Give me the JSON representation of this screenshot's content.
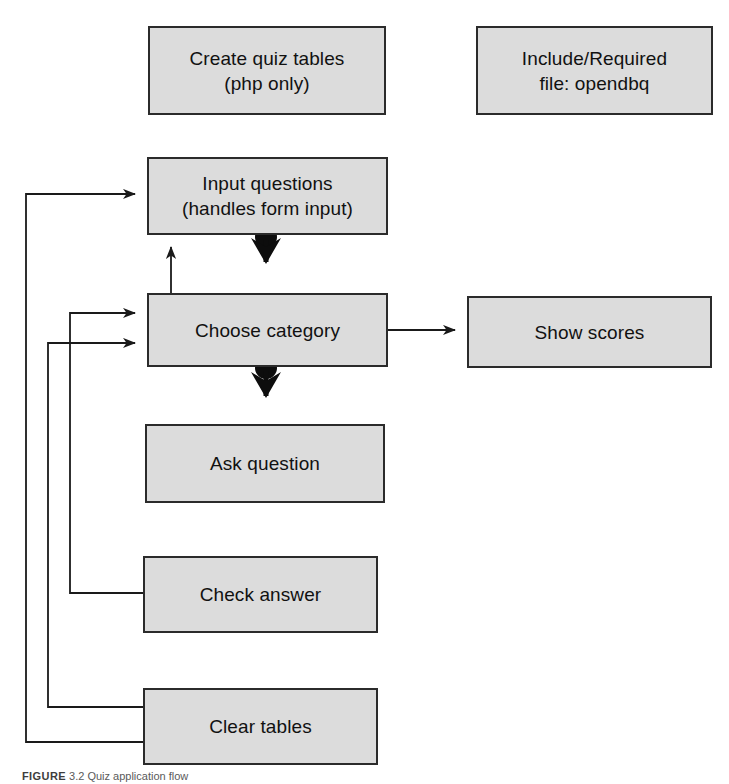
{
  "figure": {
    "caption_tag": "FIGURE",
    "caption_number": "3.2",
    "caption_text": "Quiz application flow",
    "width": 729,
    "height": 784,
    "background_color": "#ffffff"
  },
  "style": {
    "node_fill": "#dcdcdc",
    "node_border": "#2b2b2b",
    "edge_color": "#1a1a1a",
    "text_color": "#111111"
  },
  "diagram": {
    "type": "flowchart",
    "nodes": [
      {
        "id": "create-quiz-tables",
        "label": "Create quiz tables\n(php only)",
        "x": 148,
        "y": 26,
        "width": 238,
        "height": 89
      },
      {
        "id": "include-required",
        "label": "Include/Required\nfile: opendbq",
        "x": 476,
        "y": 26,
        "width": 237,
        "height": 89
      },
      {
        "id": "input-questions",
        "label": "Input questions\n(handles form input)",
        "x": 147,
        "y": 157,
        "width": 241,
        "height": 78
      },
      {
        "id": "choose-category",
        "label": "Choose category",
        "x": 147,
        "y": 293,
        "width": 241,
        "height": 74
      },
      {
        "id": "show-scores",
        "label": "Show scores",
        "x": 467,
        "y": 296,
        "width": 245,
        "height": 72
      },
      {
        "id": "ask-question",
        "label": "Ask question",
        "x": 145,
        "y": 424,
        "width": 240,
        "height": 79
      },
      {
        "id": "check-answer",
        "label": "Check answer",
        "x": 143,
        "y": 556,
        "width": 235,
        "height": 77
      },
      {
        "id": "clear-tables",
        "label": "Clear tables",
        "x": 143,
        "y": 688,
        "width": 235,
        "height": 77
      }
    ],
    "edges": [
      {
        "id": "input-questions-to-choose-category",
        "from": "input-questions",
        "to": "choose-category",
        "style": "thick-ball-origin"
      },
      {
        "id": "choose-category-to-ask-question",
        "from": "choose-category",
        "to": "ask-question",
        "style": "thick-ball-origin"
      },
      {
        "id": "choose-category-to-input-questions",
        "from": "choose-category",
        "to": "input-questions",
        "style": "thin-arrow"
      },
      {
        "id": "choose-category-to-show-scores",
        "from": "choose-category",
        "to": "show-scores",
        "style": "thin-arrow"
      },
      {
        "id": "check-answer-to-choose-category",
        "from": "check-answer",
        "to": "choose-category",
        "style": "thin-arrow-left-rail"
      },
      {
        "id": "clear-tables-to-choose-category",
        "from": "clear-tables",
        "to": "choose-category",
        "style": "thin-arrow-left-rail"
      },
      {
        "id": "clear-tables-to-input-questions",
        "from": "clear-tables",
        "to": "input-questions",
        "style": "thin-arrow-left-rail"
      }
    ]
  }
}
